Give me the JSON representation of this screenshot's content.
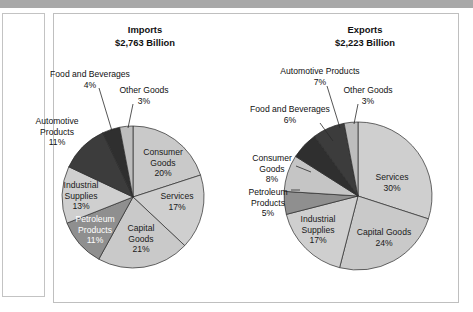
{
  "page": {
    "background_color": "#ffffff",
    "top_bar_color": "#a8a8a8",
    "panel_border_color": "#bfbfbf"
  },
  "chart_data": [
    {
      "type": "pie",
      "title": "Imports",
      "subtitle": "$2,763 Billion",
      "total_label": "$2,763 Billion",
      "center": {
        "x": 133,
        "y": 197
      },
      "radius": 71,
      "start_angle_deg": -90,
      "categories": [
        "Consumer Goods",
        "Services",
        "Capital Goods",
        "Petroleum Products",
        "Industrial Supplies",
        "Automotive Products",
        "Food and Beverages",
        "Other Goods"
      ],
      "values": [
        20,
        17,
        21,
        11,
        13,
        11,
        4,
        3
      ],
      "value_labels": [
        "20%",
        "17%",
        "21%",
        "11%",
        "13%",
        "11%",
        "4%",
        "3%"
      ],
      "colors": [
        "#c9c9c9",
        "#cfcfcf",
        "#c9c9c9",
        "#8f8f8f",
        "#cfcfcf",
        "#3c3c3c",
        "#2f2f2f",
        "#bdbdbd"
      ],
      "slice_labels": [
        {
          "name": "Consumer Goods",
          "lines": [
            "Consumer",
            "Goods",
            "20%"
          ],
          "placement": "inside",
          "x": 163,
          "y": 155,
          "text_color": "#1a1a1a"
        },
        {
          "name": "Services",
          "lines": [
            "Services",
            "17%"
          ],
          "placement": "inside",
          "x": 177,
          "y": 199,
          "text_color": "#1a1a1a"
        },
        {
          "name": "Capital Goods",
          "lines": [
            "Capital",
            "Goods",
            "21%"
          ],
          "placement": "inside",
          "x": 141,
          "y": 231,
          "text_color": "#1a1a1a"
        },
        {
          "name": "Petroleum Products",
          "lines": [
            "Petroleum",
            "Products",
            "11%"
          ],
          "placement": "inside",
          "x": 95,
          "y": 222,
          "text_color": "#ffffff"
        },
        {
          "name": "Industrial Supplies",
          "lines": [
            "Industrial",
            "Supplies",
            "13%"
          ],
          "placement": "inside",
          "x": 81,
          "y": 188,
          "text_color": "#1a1a1a"
        },
        {
          "name": "Automotive Products",
          "lines": [
            "Automotive",
            "Products",
            "11%"
          ],
          "placement": "outside-left",
          "x": 57,
          "y": 124,
          "text_color": "#111111"
        },
        {
          "name": "Food and Beverages",
          "lines": [
            "Food and Beverages",
            "4%"
          ],
          "placement": "outside-top",
          "x": 90,
          "y": 77,
          "text_color": "#111111"
        },
        {
          "name": "Other Goods",
          "lines": [
            "Other Goods",
            "3%"
          ],
          "placement": "outside-top",
          "x": 144,
          "y": 93,
          "text_color": "#111111"
        }
      ],
      "leaders": [
        {
          "name": "food-and-beverages-leader",
          "x1": 99,
          "y1": 88,
          "x2": 112,
          "y2": 131
        },
        {
          "name": "other-goods-leader",
          "x1": 133,
          "y1": 104,
          "x2": 128,
          "y2": 128
        }
      ]
    },
    {
      "type": "pie",
      "title": "Exports",
      "subtitle": "$2,223 Billion",
      "total_label": "$2,223 Billion",
      "center": {
        "x": 358,
        "y": 196
      },
      "radius": 74,
      "start_angle_deg": -90,
      "categories": [
        "Services",
        "Capital Goods",
        "Industrial Supplies",
        "Petroleum Products",
        "Consumer Goods",
        "Food and Beverages",
        "Automotive Products",
        "Other Goods"
      ],
      "values": [
        30,
        24,
        17,
        5,
        8,
        6,
        7,
        3
      ],
      "value_labels": [
        "30%",
        "24%",
        "17%",
        "5%",
        "8%",
        "6%",
        "7%",
        "3%"
      ],
      "colors": [
        "#cfcfcf",
        "#c9c9c9",
        "#cfcfcf",
        "#8f8f8f",
        "#c5c5c5",
        "#2f2f2f",
        "#3c3c3c",
        "#bdbdbd"
      ],
      "slice_labels": [
        {
          "name": "Services",
          "lines": [
            "Services",
            "30%"
          ],
          "placement": "inside",
          "x": 392,
          "y": 180,
          "text_color": "#1a1a1a"
        },
        {
          "name": "Capital Goods",
          "lines": [
            "Capital Goods",
            "24%"
          ],
          "placement": "inside",
          "x": 384,
          "y": 235,
          "text_color": "#1a1a1a"
        },
        {
          "name": "Industrial Supplies",
          "lines": [
            "Industrial",
            "Supplies",
            "17%"
          ],
          "placement": "inside",
          "x": 318,
          "y": 222,
          "text_color": "#1a1a1a"
        },
        {
          "name": "Petroleum Products",
          "lines": [
            "Petroleum",
            "Products",
            "5%"
          ],
          "placement": "outside-left",
          "x": 268,
          "y": 195,
          "text_color": "#111111"
        },
        {
          "name": "Consumer Goods",
          "lines": [
            "Consumer",
            "Goods",
            "8%"
          ],
          "placement": "outside-left",
          "x": 272,
          "y": 161,
          "text_color": "#111111"
        },
        {
          "name": "Food and Beverages",
          "lines": [
            "Food and Beverages",
            "6%"
          ],
          "placement": "outside-left",
          "x": 290,
          "y": 112,
          "text_color": "#111111"
        },
        {
          "name": "Automotive Products",
          "lines": [
            "Automotive Products",
            "7%"
          ],
          "placement": "outside-top",
          "x": 320,
          "y": 74,
          "text_color": "#111111"
        },
        {
          "name": "Other Goods",
          "lines": [
            "Other Goods",
            "3%"
          ],
          "placement": "outside-top",
          "x": 368,
          "y": 93,
          "text_color": "#111111"
        }
      ],
      "leaders": [
        {
          "name": "petroleum-products-leader",
          "x1": 291,
          "y1": 190,
          "x2": 300,
          "y2": 190
        },
        {
          "name": "consumer-goods-leader",
          "x1": 296,
          "y1": 166,
          "x2": 311,
          "y2": 172
        },
        {
          "name": "food-and-beverages-leader",
          "x1": 320,
          "y1": 123,
          "x2": 333,
          "y2": 141
        },
        {
          "name": "automotive-products-leader",
          "x1": 327,
          "y1": 86,
          "x2": 340,
          "y2": 128
        },
        {
          "name": "other-goods-leader",
          "x1": 358,
          "y1": 104,
          "x2": 354,
          "y2": 124
        }
      ]
    }
  ]
}
